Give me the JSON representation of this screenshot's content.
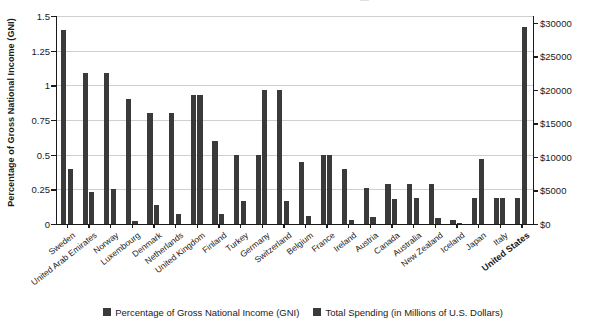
{
  "top_cut_text": "—",
  "axes": {
    "left_title": "Percentage of Gross National Income (GNI)",
    "right_title": "Total Spending (in Millions of U.S. Dollars)",
    "left_ticks": [
      "1.5",
      "1.25",
      "1",
      "0.75",
      "0.5",
      "0.25",
      "0"
    ],
    "right_ticks": [
      "$30000",
      "$25000",
      "$20000",
      "$15000",
      "$10000",
      "$5000",
      "$0"
    ]
  },
  "legend": {
    "items": [
      {
        "label": "Percentage of Gross National Income (GNI)",
        "color": "#3a3a3a"
      },
      {
        "label": "Total Spending (in Millions of U.S. Dollars)",
        "color": "#3a3a3a"
      }
    ]
  },
  "chart_data": {
    "type": "bar",
    "title": "",
    "xlabel": "",
    "ylabel": "Percentage of Gross National Income (GNI)",
    "y2label": "Total Spending (in Millions of U.S. Dollars)",
    "ylim": [
      0,
      1.5
    ],
    "y2lim": [
      0,
      31000
    ],
    "grid": true,
    "legend_position": "bottom",
    "categories": [
      "Sweden",
      "United Arab Emirates",
      "Norway",
      "Luxembourg",
      "Denmark",
      "Netherlands",
      "United Kingdom",
      "Finland",
      "Turkey",
      "Germany",
      "Switzerland",
      "Belgium",
      "France",
      "Ireland",
      "Austria",
      "Canada",
      "Australia",
      "New Zealand",
      "Iceland",
      "Japan",
      "Italy",
      "United States"
    ],
    "series": [
      {
        "name": "Percentage of Gross National Income (GNI)",
        "axis": "left",
        "color": "#3a3a3a",
        "values": [
          1.4,
          1.09,
          1.09,
          0.9,
          0.8,
          0.8,
          0.93,
          0.6,
          0.5,
          0.5,
          0.97,
          0.45,
          0.5,
          0.4,
          0.26,
          0.29,
          0.29,
          0.29,
          0.03,
          0.19,
          0.19,
          0.19
        ]
      },
      {
        "name": "Total Spending (in Millions of U.S. Dollars)",
        "axis": "right",
        "color": "#3a3a3a",
        "values": [
          8200,
          4700,
          5200,
          400,
          2900,
          1500,
          19300,
          1500,
          3400,
          20200,
          3400,
          1300,
          10400,
          600,
          1000,
          3700,
          4000,
          800,
          100,
          9700,
          4000,
          30800
        ]
      }
    ],
    "y2_values_as_gni_scale": [
      0.4,
      0.23,
      0.25,
      0.02,
      0.14,
      0.07,
      0.93,
      0.07,
      0.165,
      0.97,
      0.165,
      0.06,
      0.5,
      0.03,
      0.05,
      0.18,
      0.19,
      0.04,
      0.005,
      0.47,
      0.19,
      1.42
    ]
  }
}
